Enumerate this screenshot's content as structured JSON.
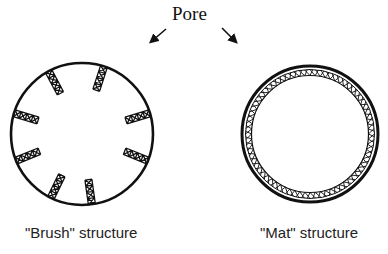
{
  "diagram": {
    "pore_label": "Pore",
    "brush": {
      "caption": "\"Brush\" structure",
      "center": [
        82,
        134
      ],
      "radius": 71,
      "element_angles_deg": [
        -118,
        -72,
        -163,
        -17,
        158,
        22,
        116,
        82
      ]
    },
    "mat": {
      "caption": "\"Mat\" structure",
      "center": [
        310,
        134
      ],
      "outer_radius": 68
    },
    "colors": {
      "stroke": "#111111",
      "background": "#ffffff"
    }
  }
}
